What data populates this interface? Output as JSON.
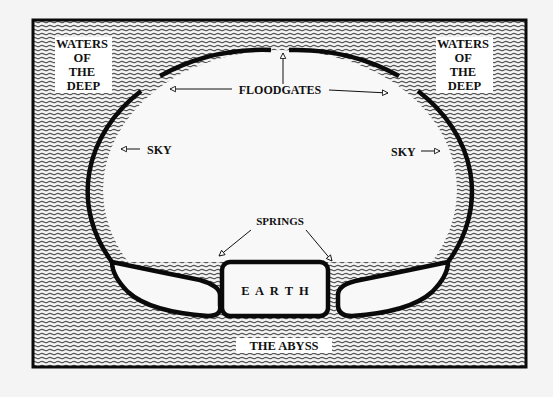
{
  "diagram": {
    "type": "cosmology-diagram",
    "colors": {
      "background": "#f4f4f4",
      "water_lines": "#444444",
      "outline": "#0a0a0a",
      "label_bg": "#ffffff",
      "text": "#111111"
    },
    "labels": {
      "waters_left": [
        "WATERS",
        "OF",
        "THE",
        "DEEP"
      ],
      "waters_right": [
        "WATERS",
        "OF",
        "THE",
        "DEEP"
      ],
      "floodgates": "FLOODGATES",
      "sky_left": "SKY",
      "sky_right": "SKY",
      "springs": "SPRINGS",
      "earth": "E  A  R  T  H",
      "abyss": "THE ABYSS"
    }
  }
}
